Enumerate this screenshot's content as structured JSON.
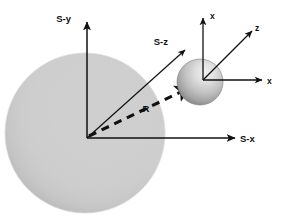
{
  "figure": {
    "background_color": "#ffffff",
    "width": 286,
    "height": 217
  },
  "labels": {
    "s_y": "S-y",
    "s_z": "S-z",
    "s_x": "S-x",
    "local_x_up": "x",
    "local_z": "z",
    "local_x_right": "x",
    "r_vector": "R"
  },
  "colors": {
    "stroke": "#111111",
    "text": "#111111",
    "sphere_light": "#ffffff",
    "sphere_shadow": "#9b9b9b",
    "sphere_mid": "#c9c9c9",
    "small_sphere_dark": "#6f6f6f",
    "small_sphere_light": "#e8e8e8"
  },
  "geometry": {
    "s_origin": {
      "x": 87,
      "y": 138
    },
    "local_origin": {
      "x": 203,
      "y": 80
    },
    "large_sphere": {
      "cx": 85,
      "cy": 133,
      "r": 80
    },
    "small_sphere": {
      "cx": 200,
      "cy": 82,
      "r": 23
    }
  },
  "elements": {
    "large_sphere_name": "large-sphere",
    "small_sphere_name": "small-sphere",
    "s_frame_name": "s-coordinate-frame",
    "local_frame_name": "local-coordinate-frame",
    "r_arrow_name": "r-vector-arrow"
  }
}
